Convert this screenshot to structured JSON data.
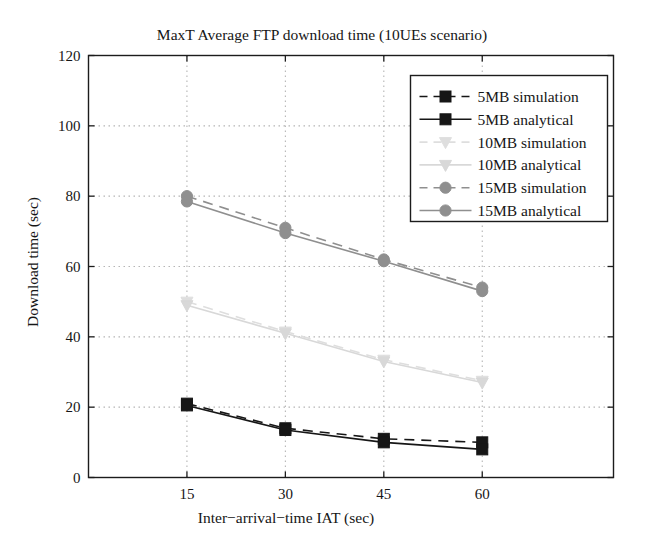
{
  "figure": {
    "title": "MaxT Average FTP download time (10UEs scenario)",
    "xlabel": "Inter−arrival−time IAT (sec)",
    "ylabel": "Download time (sec)"
  },
  "chart_data": {
    "type": "line",
    "title": "MaxT Average FTP download time (10UEs scenario)",
    "xlabel": "Inter−arrival−time IAT (sec)",
    "ylabel": "Download time (sec)",
    "x": [
      15,
      30,
      45,
      60
    ],
    "xlim": [
      0,
      80
    ],
    "ylim": [
      0,
      120
    ],
    "xticks": [
      15,
      30,
      45,
      60
    ],
    "yticks": [
      0,
      20,
      40,
      60,
      80,
      100,
      120
    ],
    "grid": "dotted",
    "legend_position": "upper right",
    "series": [
      {
        "name": "5MB simulation",
        "values": [
          21,
          14,
          11,
          10
        ],
        "line": "dashed",
        "marker": "square",
        "color": "#161616"
      },
      {
        "name": "5MB analytical",
        "values": [
          20.5,
          13.5,
          10,
          8
        ],
        "line": "solid",
        "marker": "square",
        "color": "#161616"
      },
      {
        "name": "10MB simulation",
        "values": [
          50,
          41.5,
          33.5,
          27.5
        ],
        "line": "dashed",
        "marker": "triangle-down",
        "color": "#dedede"
      },
      {
        "name": "10MB analytical",
        "values": [
          49,
          41,
          33,
          27
        ],
        "line": "solid",
        "marker": "triangle-down",
        "color": "#d8d8d8"
      },
      {
        "name": "15MB simulation",
        "values": [
          80,
          71,
          62,
          54
        ],
        "line": "dashed",
        "marker": "circle",
        "color": "#8f8f8f"
      },
      {
        "name": "15MB analytical",
        "values": [
          78.5,
          69.5,
          61.5,
          53
        ],
        "line": "solid",
        "marker": "circle",
        "color": "#8f8f8f"
      }
    ],
    "colors": {
      "axis": "#1c1c1c",
      "grid": "#b5b5b5",
      "text": "#161616",
      "background": "#ffffff"
    }
  }
}
